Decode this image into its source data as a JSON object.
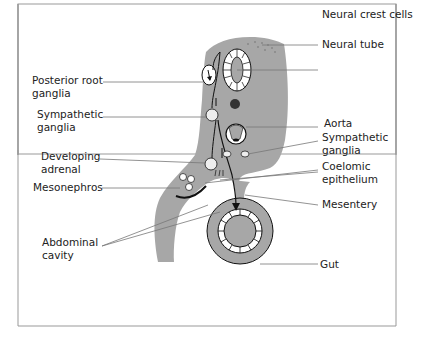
{
  "figure": {
    "colors": {
      "tissue": "#a7a7a7",
      "outline": "#111111",
      "leader": "#777777",
      "frame": "#999999",
      "dot": "#333333"
    }
  },
  "labels": {
    "neural_crest": "Neural crest cells",
    "neural_tube": "Neural tube",
    "posterior_root_1": "Posterior root",
    "posterior_root_2": "ganglia",
    "symp_left_1": "Sympathetic",
    "symp_left_2": "ganglia",
    "aorta": "Aorta",
    "symp_right_1": "Sympathetic",
    "symp_right_2": "ganglia",
    "developing_1": "Developing",
    "developing_2": "adrenal",
    "coelomic_1": "Coelomic",
    "coelomic_2": "epithelium",
    "mesonephros": "Mesonephros",
    "mesentery": "Mesentery",
    "abdominal_1": "Abdominal",
    "abdominal_2": "cavity",
    "gut": "Gut"
  }
}
